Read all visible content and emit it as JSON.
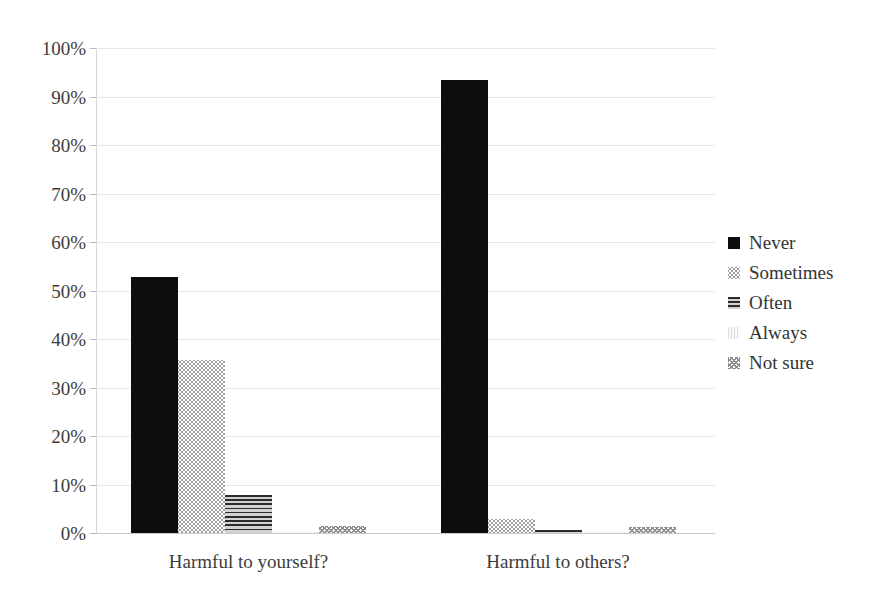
{
  "chart_data": {
    "type": "bar",
    "title": "",
    "subtitle": "",
    "xlabel": "",
    "ylabel": "",
    "categories": [
      "Harmful to yourself?",
      "Harmful to others?"
    ],
    "series": [
      {
        "name": "Never",
        "values": [
          52.7,
          93.4
        ],
        "pattern": "solid-black",
        "swatch": "pat-never"
      },
      {
        "name": "Sometimes",
        "values": [
          35.7,
          2.8
        ],
        "pattern": "light-dots",
        "swatch": "pat-sometimes"
      },
      {
        "name": "Often",
        "values": [
          7.9,
          0.6
        ],
        "pattern": "horizontal-lines",
        "swatch": "pat-often"
      },
      {
        "name": "Always",
        "values": [
          0.3,
          0.1
        ],
        "pattern": "very-light-wash",
        "swatch": "pat-always"
      },
      {
        "name": "Not sure",
        "values": [
          1.4,
          1.2
        ],
        "pattern": "checker-dots",
        "swatch": "pat-notsure"
      }
    ],
    "ylim": [
      0,
      100
    ],
    "yticks": [
      0,
      10,
      20,
      30,
      40,
      50,
      60,
      70,
      80,
      90,
      100
    ],
    "ytick_labels": [
      "0%",
      "10%",
      "20%",
      "30%",
      "40%",
      "50%",
      "60%",
      "70%",
      "80%",
      "90%",
      "100%"
    ],
    "grid": true,
    "grid_axis": "y",
    "legend_position": "right",
    "value_format": "percent"
  },
  "legend": {
    "items": [
      {
        "label": "Never"
      },
      {
        "label": "Sometimes"
      },
      {
        "label": "Often"
      },
      {
        "label": "Always"
      },
      {
        "label": "Not sure"
      }
    ]
  }
}
